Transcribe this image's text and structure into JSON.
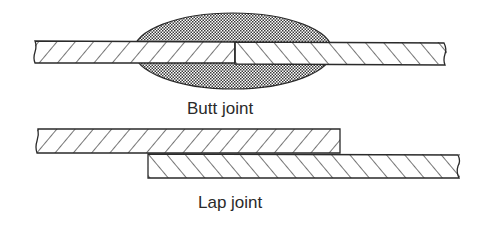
{
  "diagram": {
    "butt_joint": {
      "label": "Butt joint",
      "plates": [
        {
          "side": "left",
          "hatch": "forward-slash"
        },
        {
          "side": "right",
          "hatch": "back-slash"
        }
      ],
      "weld": "elliptical weld bead above and below plates, crosshatched"
    },
    "lap_joint": {
      "label": "Lap joint",
      "plates": [
        {
          "position": "upper-left",
          "hatch": "forward-slash"
        },
        {
          "position": "lower-right",
          "hatch": "back-slash"
        }
      ]
    }
  },
  "colors": {
    "stroke": "#2a2a2a",
    "weld_fill": "#555555",
    "background": "#ffffff"
  }
}
